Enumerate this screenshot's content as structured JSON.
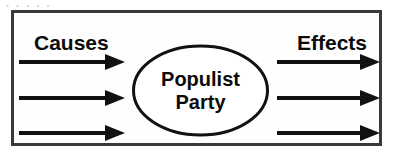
{
  "diagram": {
    "type": "cause-and-effect",
    "frame": {
      "border_color": "#3a3a3a",
      "background": "#fefefe"
    },
    "clipped_header_remnant": ". . . . .",
    "left_heading": "Causes",
    "right_heading": "Effects",
    "center_node": {
      "shape": "ellipse",
      "line_1": "Populist",
      "line_2": "Party",
      "stroke_color": "#111111"
    },
    "cause_arrows": [
      {
        "label": "cause-arrow-1",
        "direction": "right"
      },
      {
        "label": "cause-arrow-2",
        "direction": "right"
      },
      {
        "label": "cause-arrow-3",
        "direction": "right"
      }
    ],
    "effect_arrows": [
      {
        "label": "effect-arrow-1",
        "direction": "right"
      },
      {
        "label": "effect-arrow-2",
        "direction": "right"
      },
      {
        "label": "effect-arrow-3",
        "direction": "right"
      }
    ],
    "colors": {
      "ink": "#0b0b0b",
      "arrow": "#111111",
      "frame": "#3a3a3a"
    }
  }
}
